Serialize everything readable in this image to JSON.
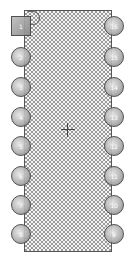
{
  "component": {
    "type": "DIP-16 IC footprint",
    "pins_left": [
      {
        "label": "1",
        "y": 16,
        "shape": "square"
      },
      {
        "label": "2",
        "y": 47
      },
      {
        "label": "3",
        "y": 77
      },
      {
        "label": "4",
        "y": 107
      },
      {
        "label": "5",
        "y": 136
      },
      {
        "label": "6",
        "y": 166
      },
      {
        "label": "7",
        "y": 195
      },
      {
        "label": "8",
        "y": 224
      }
    ],
    "pins_right": [
      {
        "label": "16",
        "y": 16
      },
      {
        "label": "15",
        "y": 47
      },
      {
        "label": "14",
        "y": 77
      },
      {
        "label": "13",
        "y": 107
      },
      {
        "label": "12",
        "y": 136
      },
      {
        "label": "11",
        "y": 166
      },
      {
        "label": "10",
        "y": 195
      },
      {
        "label": "9",
        "y": 224
      }
    ],
    "colors": {
      "outline": "#555555",
      "hatch": "#9a9a9a",
      "pin": "#b0b0b0"
    }
  }
}
